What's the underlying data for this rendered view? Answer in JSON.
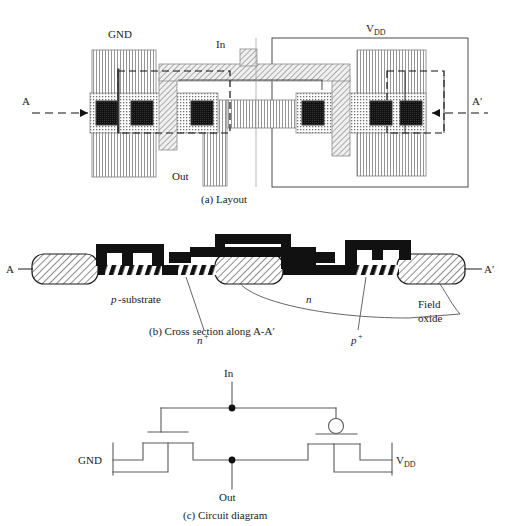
{
  "figure": {
    "title_semantic": "CMOS inverter layout, cross section and circuit diagram",
    "panels": [
      {
        "id": "a",
        "caption": "(a) Layout"
      },
      {
        "id": "b",
        "caption": "(b) Cross section along A-A′"
      },
      {
        "id": "c",
        "caption": "(c) Circuit diagram"
      }
    ]
  },
  "layout": {
    "caption": "(a) Layout",
    "labels": {
      "gnd": "GND",
      "vdd_main": "V",
      "vdd_sub": "DD",
      "in": "In",
      "out": "Out",
      "section_left": "A",
      "section_right": "A′"
    },
    "colors": {
      "metal_fill": "#e8e8e8",
      "metal_line": "#6b6b6b",
      "poly_fill": "#d9d9d9",
      "poly_line": "#6b6b6b",
      "diffusion_dot": "#555555",
      "contact_fill": "#111111",
      "outline": "#3a3a3a",
      "dashed": "#111111"
    },
    "legend_semantics": {
      "vertical_hatch": "metal layer",
      "diagonal_hatch": "polysilicon layer",
      "dotted": "diffusion / active region",
      "black_square": "contact cut",
      "dashed_rect": "well or implant mask",
      "solid_rect": "n-well boundary"
    }
  },
  "cross_section": {
    "caption": "(b) Cross section along A-A′",
    "labels": {
      "section_left": "A",
      "section_right": "A′",
      "p_substrate_italic": "p",
      "p_substrate_rest": "-substrate",
      "n_plus_main": "n",
      "n_plus_sup": "+",
      "n_well": "n",
      "p_plus_main": "p",
      "p_plus_sup": "+",
      "field_oxide_line1": "Field",
      "field_oxide_line2": "oxide"
    },
    "colors": {
      "black": "#111111",
      "oxide_fill": "#ffffff",
      "oxide_hatch": "#1a1a1a",
      "leader": "#555555"
    }
  },
  "circuit": {
    "caption": "(c) Circuit diagram",
    "labels": {
      "in": "In",
      "out": "Out",
      "gnd": "GND",
      "vdd_main": "V",
      "vdd_sub": "DD"
    },
    "colors": {
      "wire": "#5a5a5a",
      "node_dot": "#111111",
      "bubble_stroke": "#5a5a5a",
      "bubble_fill": "#ffffff"
    },
    "devices": [
      {
        "name": "nmos",
        "type": "n-channel MOSFET",
        "source_label": "GND",
        "drain_label": "Out",
        "gate_label": "In",
        "inverting_bubble": false
      },
      {
        "name": "pmos",
        "type": "p-channel MOSFET",
        "source_label": "V DD",
        "drain_label": "Out",
        "gate_label": "In",
        "inverting_bubble": true
      }
    ]
  }
}
